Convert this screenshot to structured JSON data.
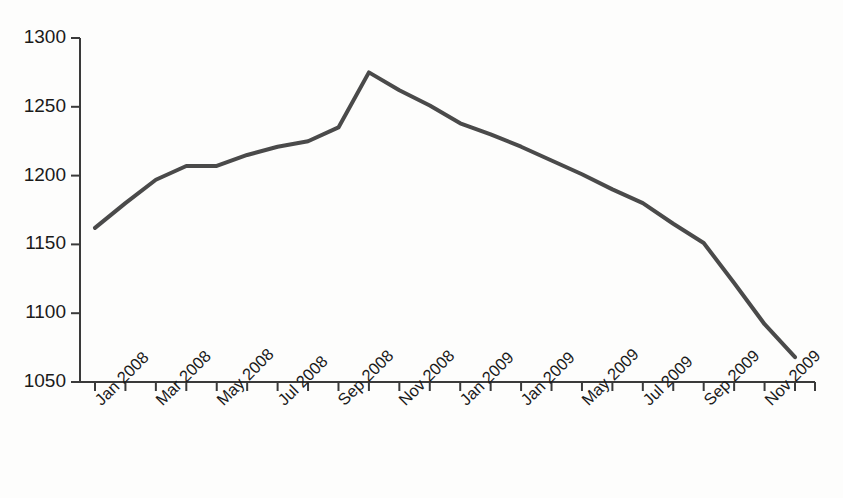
{
  "chart_data": {
    "type": "line",
    "title": "",
    "subtitle": "",
    "xlabel": "",
    "ylabel": "",
    "grid": false,
    "legend": false,
    "legend_position": "none",
    "line_color": "#4a4a4a",
    "axis_color": "#3a3a3a",
    "background_color": "#fdfdfc",
    "ylim": [
      1050,
      1300
    ],
    "yticks": [
      1050,
      1100,
      1150,
      1200,
      1250,
      1300
    ],
    "ytick_labels": [
      "1050",
      "1100",
      "1150",
      "1200",
      "1250",
      "1300"
    ],
    "x": [
      "Jan 2008",
      "Feb 2008",
      "Mar 2008",
      "Apr 2008",
      "May 2008",
      "Jun 2008",
      "Jul 2008",
      "Aug 2008",
      "Sep 2008",
      "Oct 2008",
      "Nov 2008",
      "Dec 2008",
      "Jan 2009",
      "Feb 2009",
      "Mar 2009",
      "Apr 2009",
      "May 2009",
      "Jun 2009",
      "Jul 2009",
      "Aug 2009",
      "Sep 2009",
      "Oct 2009",
      "Nov 2009",
      "Dec 2009"
    ],
    "xtick_labels": [
      "Jan 2008",
      "",
      "Mar 2008",
      "",
      "May 2008",
      "",
      "Jul 2008",
      "",
      "Sep 2008",
      "",
      "Nov 2008",
      "",
      "Jan 2009",
      "",
      "Jan 2009",
      "",
      "May 2009",
      "",
      "Jul 2009",
      "",
      "Sep 2009",
      "",
      "Nov 2009",
      ""
    ],
    "values": [
      1162,
      1180,
      1197,
      1207,
      1207,
      1215,
      1221,
      1225,
      1235,
      1275,
      1262,
      1251,
      1238,
      1230,
      1221,
      1211,
      1201,
      1190,
      1180,
      1165,
      1151,
      1122,
      1092,
      1068
    ],
    "series": [
      {
        "name": "series-1",
        "values": [
          1162,
          1180,
          1197,
          1207,
          1207,
          1215,
          1221,
          1225,
          1235,
          1275,
          1262,
          1251,
          1238,
          1230,
          1221,
          1211,
          1201,
          1190,
          1180,
          1165,
          1151,
          1122,
          1092,
          1068
        ]
      }
    ]
  }
}
